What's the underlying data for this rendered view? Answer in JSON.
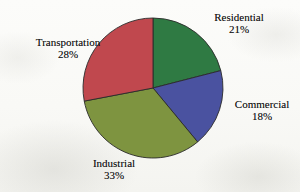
{
  "chart_data": {
    "type": "pie",
    "title": "",
    "subtitle": "",
    "xlabel": "",
    "ylabel": "",
    "grid": false,
    "legend_position": "none",
    "labels_position": "outside-callout",
    "start_angle_deg": 0,
    "direction": "clockwise",
    "categories": [
      "Residential",
      "Commercial",
      "Industrial",
      "Transportation"
    ],
    "values": [
      21,
      18,
      33,
      28
    ],
    "units": "%",
    "total": 100,
    "colors": [
      "#2F7A43",
      "#4A52A0",
      "#7E9440",
      "#C0484E"
    ],
    "slices": [
      {
        "label": "Residential",
        "value": 21,
        "value_text": "21%",
        "color": "#2F7A43"
      },
      {
        "label": "Commercial",
        "value": 18,
        "value_text": "18%",
        "color": "#4A52A0"
      },
      {
        "label": "Industrial",
        "value": 33,
        "value_text": "33%",
        "color": "#7E9440"
      },
      {
        "label": "Transportation",
        "value": 28,
        "value_text": "28%",
        "color": "#C0484E"
      }
    ]
  },
  "labels": {
    "residential": {
      "name": "Residential",
      "pct": "21%"
    },
    "commercial": {
      "name": "Commercial",
      "pct": "18%"
    },
    "industrial": {
      "name": "Industrial",
      "pct": "33%"
    },
    "transportation": {
      "name": "Transportation",
      "pct": "28%"
    }
  },
  "style": {
    "background": "#fbfbf9",
    "outline": "#2a2a2a",
    "text": "#111111"
  }
}
